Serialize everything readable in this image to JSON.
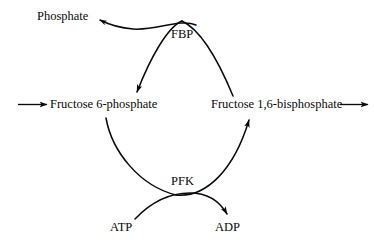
{
  "diagram": {
    "type": "biochemical-pathway",
    "background_color": "#ffffff",
    "stroke_color": "#0a0a0a",
    "nodes": {
      "phosphate": "Phosphate",
      "fbp_enzyme": "FBP",
      "fructose_6_phosphate": "Fructose 6-phosphate",
      "fructose_1_6_bisphosphate": "Fructose 1,6-bisphosphate",
      "pfk_enzyme": "PFK",
      "atp": "ATP",
      "adp": "ADP"
    },
    "edges": [
      {
        "name": "input-arrow",
        "from": "",
        "to": "Fructose 6-phosphate",
        "style": "straight",
        "arrowhead": "end"
      },
      {
        "name": "output-arrow",
        "from": "Fructose 1,6-bisphosphate",
        "to": "",
        "style": "straight",
        "arrowhead": "end"
      },
      {
        "name": "fbp-reaction-arc",
        "from": "Fructose 1,6-bisphosphate",
        "to": "Fructose 6-phosphate",
        "enzyme": "FBP",
        "style": "curved",
        "arrowhead": "end"
      },
      {
        "name": "phosphate-release-arc",
        "from": "FBP",
        "to": "Phosphate",
        "style": "curved",
        "arrowhead": "end"
      },
      {
        "name": "pfk-reaction-arc",
        "from": "Fructose 6-phosphate",
        "to": "Fructose 1,6-bisphosphate",
        "enzyme": "PFK",
        "style": "curved",
        "arrowhead": "end"
      },
      {
        "name": "atp-adp-arc",
        "from": "ATP",
        "to": "ADP",
        "style": "curved",
        "arrowhead": "end"
      }
    ]
  }
}
